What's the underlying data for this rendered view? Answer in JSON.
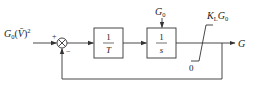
{
  "diagram": {
    "type": "block-diagram",
    "input": {
      "label_main": "G",
      "label_sub": "0",
      "label_rest": "(",
      "label_var": "V̄",
      "label_close": ")",
      "label_exp": "2"
    },
    "summing_junction": {
      "plus_sign": "+",
      "minus_sign": "−"
    },
    "block_1": {
      "numerator": "1",
      "denominator": "T"
    },
    "block_2": {
      "numerator": "1",
      "denominator": "s"
    },
    "block_2_input": {
      "label_main": "G",
      "label_sub": "0"
    },
    "saturation": {
      "upper_label_k": "K",
      "upper_label_k_sub": "L",
      "upper_label_g": "G",
      "upper_label_g_sub": "0",
      "lower_label": "0"
    },
    "output": {
      "label": "G"
    },
    "colors": {
      "line": "#333333",
      "text": "#222222",
      "background": "#ffffff"
    }
  }
}
